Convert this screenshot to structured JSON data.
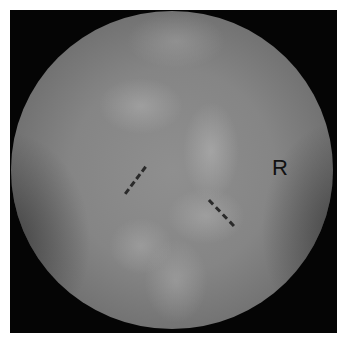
{
  "image": {
    "type": "fluoroscopy",
    "orientation_label": "R",
    "colors": {
      "border": "#ffffff",
      "background": "#050505",
      "field_mid": "#858585",
      "marker": "#2a2a2a"
    },
    "markers": [
      {
        "name": "left-dashed-marker",
        "from": [
          124,
          193
        ],
        "to": [
          144,
          166
        ]
      },
      {
        "name": "right-dashed-marker",
        "from": [
          210,
          199
        ],
        "to": [
          235,
          225
        ]
      }
    ]
  }
}
